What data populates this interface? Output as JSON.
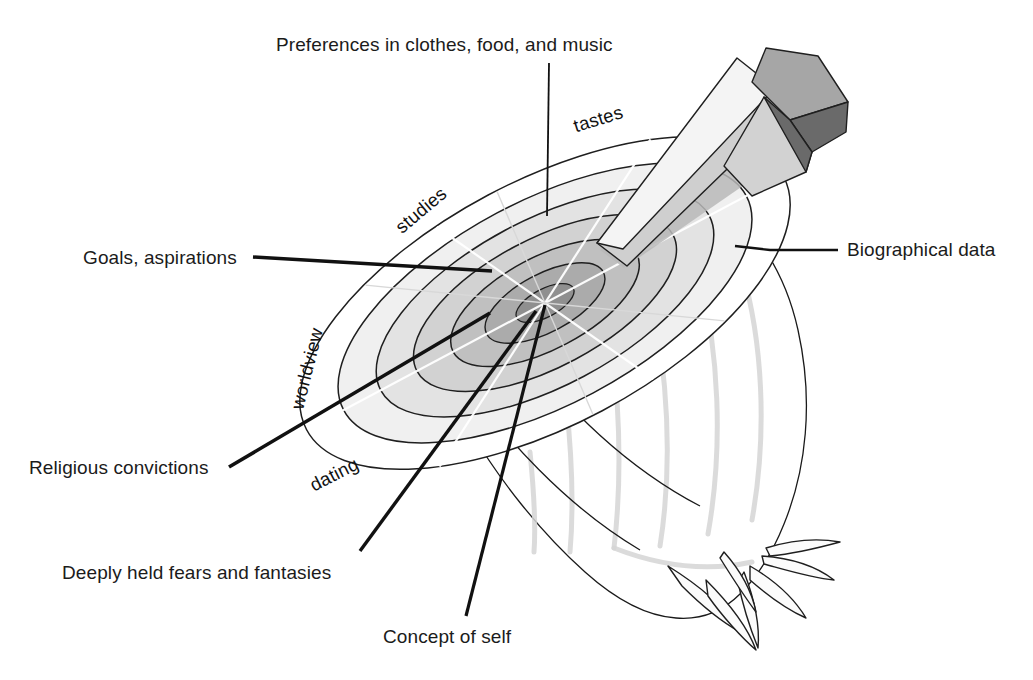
{
  "figure": {
    "background_color": "#ffffff",
    "ink_color": "#1b1b1b"
  },
  "callouts": [
    {
      "id": "preferences",
      "label": "Preferences in clothes, food, and music",
      "text_x": 276,
      "text_y": 51,
      "anchor": "start",
      "leader": "M 549 63 L 547 216",
      "leader_width": 1.8
    },
    {
      "id": "goals",
      "label": "Goals, aspirations",
      "text_x": 83,
      "text_y": 264,
      "anchor": "start",
      "leader": "M 253 257 L 492 271",
      "leader_width": 3.4
    },
    {
      "id": "biographical",
      "label": "Biographical data",
      "text_x": 847,
      "text_y": 256,
      "anchor": "start",
      "leader": "M 735 246 L 770 250 L 838 250",
      "leader_width": 2.4
    },
    {
      "id": "religious",
      "label": "Religious convictions",
      "text_x": 29,
      "text_y": 474,
      "anchor": "start",
      "leader": "M 229 467 L 490 313",
      "leader_width": 3.6
    },
    {
      "id": "fears",
      "label": "Deeply held fears and fantasies",
      "text_x": 62,
      "text_y": 579,
      "anchor": "start",
      "leader": "M 360 551 L 536 311",
      "leader_width": 3.4
    },
    {
      "id": "concept-of-self",
      "label": "Concept of self",
      "text_x": 383,
      "text_y": 643,
      "anchor": "start",
      "leader": "M 466 616 L 545 305",
      "leader_width": 3.2
    }
  ],
  "ring_labels": [
    {
      "id": "tastes",
      "label": "tastes",
      "x": 600,
      "y": 125,
      "rotate": -17
    },
    {
      "id": "studies",
      "label": "studies",
      "x": 425,
      "y": 215,
      "rotate": -40
    },
    {
      "id": "worldview",
      "label": "worldview",
      "x": 313,
      "y": 370,
      "rotate": -76
    },
    {
      "id": "dating",
      "label": "dating",
      "x": 337,
      "y": 480,
      "rotate": -27
    }
  ],
  "onion_rings": [
    {
      "id": "ring-outer-1",
      "rx": 270,
      "ry": 122,
      "fill": "#ffffff"
    },
    {
      "id": "ring-outer-2",
      "rx": 228,
      "ry": 102,
      "fill": "#f0f0f0"
    },
    {
      "id": "ring-3",
      "rx": 186,
      "ry": 83,
      "fill": "#e3e3e3"
    },
    {
      "id": "ring-4",
      "rx": 145,
      "ry": 64,
      "fill": "#d2d2d2"
    },
    {
      "id": "ring-5",
      "rx": 104,
      "ry": 46,
      "fill": "#c0c0c0"
    },
    {
      "id": "ring-6",
      "rx": 66,
      "ry": 29,
      "fill": "#ababab"
    },
    {
      "id": "ring-core",
      "rx": 32,
      "ry": 14,
      "fill": "#8f8f8f"
    }
  ],
  "ring_geometry": {
    "center_x": 545,
    "center_y": 303,
    "rotation_deg": -28
  },
  "knife": {
    "blade_fill": "#f2f2f2",
    "blade_shadow_fill": "#cfcfcf",
    "handle_top_fill": "#a9a9a9",
    "handle_side_fill": "#6e6e6e",
    "handle_front_fill": "#cdcdcd"
  },
  "onion_body": {
    "skin_fill": "#fcfcfc",
    "stripe_color": "#d5d5d5",
    "outline_color": "#1f1f1f"
  }
}
